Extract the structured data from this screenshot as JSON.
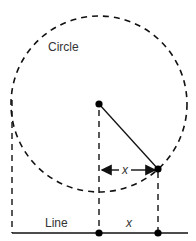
{
  "diagram": {
    "labels": {
      "circle": "Circle",
      "line": "Line",
      "x_bottom": "x",
      "x_arrow": "x"
    },
    "colors": {
      "stroke": "#111111",
      "text": "#333333",
      "background": "#ffffff"
    },
    "geometry": {
      "circle_center": [
        99,
        104
      ],
      "circle_radius": 88,
      "point_on_circle": [
        158,
        169
      ],
      "baseline_y": 233
    }
  }
}
